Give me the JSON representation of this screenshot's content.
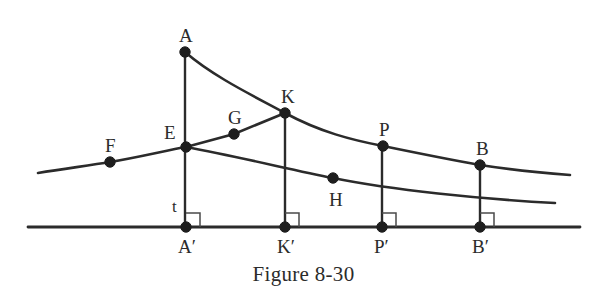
{
  "figure": {
    "caption": "Figure 8-30",
    "background_color": "#ffffff",
    "ink_color": "#2b2b2b",
    "node_color": "#1e1e1e",
    "width": 607,
    "height": 305
  },
  "labels": {
    "A": "A",
    "B": "B",
    "E": "E",
    "F": "F",
    "G": "G",
    "H": "H",
    "K": "K",
    "P": "P",
    "t": "t",
    "A_prime": "A′",
    "B_prime": "B′",
    "K_prime": "K′",
    "P_prime": "P′"
  },
  "chart_data": {
    "type": "line",
    "title": "Figure 8-30",
    "xlabel": "",
    "ylabel": "",
    "xlim": [
      0,
      607
    ],
    "ylim": [
      305,
      0
    ],
    "grid": false,
    "legend": "none",
    "note": "Geometric diagram: two descending curves above a horizontal baseline, with vertical drop lines from A, K, P, B to their feet A', K', P', B'. Coordinates are in image pixel space, y increasing downward.",
    "points": [
      {
        "name": "A",
        "x": 185,
        "y": 52,
        "marker": true,
        "label_dx": -6,
        "label_dy": -26
      },
      {
        "name": "F",
        "x": 110,
        "y": 162,
        "marker": true,
        "label_dx": -5,
        "label_dy": -26
      },
      {
        "name": "E",
        "x": 186,
        "y": 147,
        "marker": true,
        "label_dx": -22,
        "label_dy": -24
      },
      {
        "name": "G",
        "x": 234,
        "y": 134,
        "marker": true,
        "label_dx": -6,
        "label_dy": -26
      },
      {
        "name": "K",
        "x": 285,
        "y": 113,
        "marker": true,
        "label_dx": -4,
        "label_dy": -26
      },
      {
        "name": "H",
        "x": 333,
        "y": 178,
        "marker": true,
        "label_dx": -4,
        "label_dy": 12
      },
      {
        "name": "P",
        "x": 383,
        "y": 146,
        "marker": true,
        "label_dx": -4,
        "label_dy": -26
      },
      {
        "name": "B",
        "x": 480,
        "y": 165,
        "marker": true,
        "label_dx": -4,
        "label_dy": -26
      },
      {
        "name": "A′",
        "x": 186,
        "y": 227,
        "marker": true,
        "label_dx": -8,
        "label_dy": 10
      },
      {
        "name": "K′",
        "x": 285,
        "y": 227,
        "marker": true,
        "label_dx": -8,
        "label_dy": 10
      },
      {
        "name": "P′",
        "x": 382,
        "y": 227,
        "marker": true,
        "label_dx": -8,
        "label_dy": 10
      },
      {
        "name": "B′",
        "x": 480,
        "y": 227,
        "marker": true,
        "label_dx": -8,
        "label_dy": 10
      }
    ],
    "series": [
      {
        "name": "upper-curve-A-K-P-B",
        "path": "M 185 52 C 215 78, 258 98, 285 113 C 320 132, 352 140, 383 146 C 417 153, 452 160, 480 165 C 512 170, 545 173, 570 175"
      },
      {
        "name": "lower-curve-F-E-H",
        "path": "M 38 173 C 70 168, 92 165, 110 162 C 140 157, 168 150, 186 147 C 240 157, 292 170, 333 178 C 392 190, 480 199, 555 203"
      },
      {
        "name": "chord-E-G-K",
        "path": "M 186 147 L 234 134 L 285 113"
      },
      {
        "name": "baseline",
        "path": "M 28 227 L 580 227"
      }
    ],
    "drop_lines": [
      {
        "name": "A-A′",
        "x": 185,
        "y_top": 52,
        "y_bottom": 227
      },
      {
        "name": "K-K′",
        "x": 285,
        "y_top": 113,
        "y_bottom": 227
      },
      {
        "name": "P-P′",
        "x": 382,
        "y_top": 146,
        "y_bottom": 227
      },
      {
        "name": "B-B′",
        "x": 480,
        "y_top": 165,
        "y_bottom": 227
      }
    ],
    "right_angle_marks": [
      {
        "name": "at-A′",
        "x": 186,
        "y": 227,
        "size": 14
      },
      {
        "name": "at-K′",
        "x": 285,
        "y": 227,
        "size": 14
      },
      {
        "name": "at-P′",
        "x": 382,
        "y": 227,
        "size": 14
      },
      {
        "name": "at-B′",
        "x": 480,
        "y": 227,
        "size": 14
      }
    ],
    "segment_labels": [
      {
        "name": "t",
        "text": "t",
        "x": 172,
        "y": 198,
        "describes": "segment E to A′"
      }
    ]
  }
}
